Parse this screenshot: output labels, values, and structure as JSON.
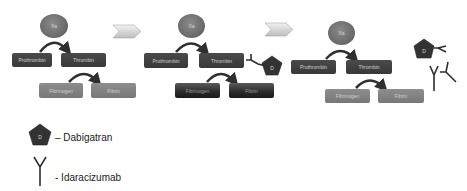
{
  "diagram": {
    "panels": [
      {
        "id": "panel-1",
        "enzyme": "Xa",
        "nodes": {
          "prothrombin": "Prothrombin",
          "thrombin": "Thrombin",
          "fibrinogen": "Fibrinogen",
          "fibrin": "Fibrin"
        },
        "state": "normal coagulation"
      },
      {
        "id": "panel-2",
        "enzyme": "Xa",
        "nodes": {
          "prothrombin": "Prothrombin",
          "thrombin": "Thrombin",
          "fibrinogen": "Fibrinogen",
          "fibrin": "Fibrin"
        },
        "inhibitor": "D",
        "state": "thrombin inhibited by dabigatran"
      },
      {
        "id": "panel-3",
        "enzyme": "Xa",
        "nodes": {
          "prothrombin": "Prothrombin",
          "thrombin": "Thrombin",
          "fibrinogen": "Fibrinogen",
          "fibrin": "Fibrin"
        },
        "bound_complex": "D",
        "state": "dabigatran neutralized by idarucizumab"
      }
    ],
    "legend": {
      "dabigatran": {
        "symbol": "D",
        "label": "– Dabigatran"
      },
      "idaracizumab": {
        "label": "- Idaracizumab"
      }
    },
    "colors": {
      "node_dark": "#3f3f3f",
      "node_mid": "#828282",
      "enzyme": "#707070",
      "pentagon": "#3a3a3a",
      "arrow": "#2f2f2f",
      "chevron": "#d9d9d9"
    }
  }
}
